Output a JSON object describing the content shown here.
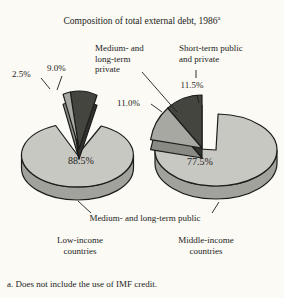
{
  "title": "Composition of total external debt, 1986",
  "title_superscript": "a",
  "footnote": "a. Does not include the use of IMF credit.",
  "colors": {
    "background": "#fbfaf5",
    "outline": "#1c1c1a",
    "text": "#1c1c1a",
    "slices": [
      {
        "name": "medium-and-long-term-public",
        "top": "#c8c8c2",
        "side": "#a2a29c"
      },
      {
        "name": "medium-and-long-term-private",
        "top": "#a8a8a2",
        "side": "#8a8a84"
      },
      {
        "name": "short-term-public-and-private",
        "top": "#454540",
        "side": "#323230"
      }
    ]
  },
  "labels": {
    "medium_long_private": "Medium- and\nlong-term\nprivate",
    "short_term_public": "Short-term public\nand private",
    "medium_long_public": "Medium- and long-term public",
    "low_income": "Low-income\ncountries",
    "middle_income": "Middle-income\ncountries"
  },
  "percent_labels": {
    "low_main": "88.5%",
    "low_private": "2.5%",
    "low_short": "9.0%",
    "mid_main": "77.5%",
    "mid_private": "11.0%",
    "mid_short": "11.5%"
  },
  "chart_data": {
    "type": "pie",
    "title": "Composition of total external debt, 1986",
    "title_note": "a. Does not include the use of IMF credit.",
    "categories": [
      "Medium- and long-term public",
      "Medium- and long-term private",
      "Short-term public and private"
    ],
    "pies": [
      {
        "name": "Low-income countries",
        "values": [
          88.5,
          2.5,
          9.0
        ]
      },
      {
        "name": "Middle-income countries",
        "values": [
          77.5,
          11.0,
          11.5
        ]
      }
    ],
    "layout_hints": {
      "style": "3d-exploded",
      "exploded_categories": [
        "Medium- and long-term private",
        "Short-term public and private"
      ],
      "legend": "labels-with-leader-lines"
    }
  }
}
